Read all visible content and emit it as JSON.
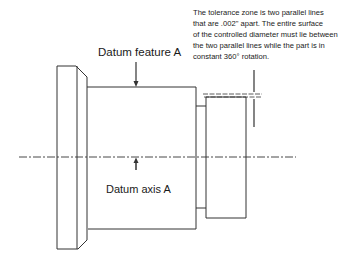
{
  "labels": {
    "datum_feature": "Datum feature A",
    "datum_axis": "Datum axis A"
  },
  "note": {
    "lines": [
      "The tolerance zone is two parallel lines",
      "that are .002\" apart. The entire surface",
      "of the controlled diameter must lie between",
      " the two parallel lines while the part is in",
      "constant 360° rotation."
    ]
  },
  "colors": {
    "line": "#333333",
    "background": "#ffffff"
  }
}
